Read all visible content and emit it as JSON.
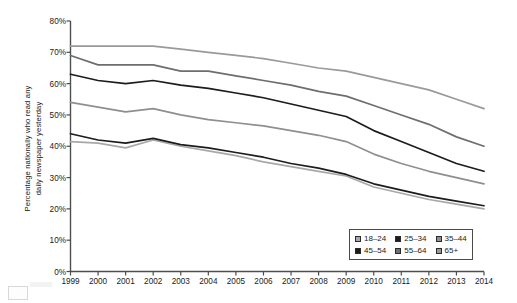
{
  "chart_data": {
    "type": "line",
    "title": "",
    "xlabel": "",
    "ylabel": "Percentage nationally who read any daily newspaper yesterday",
    "x": [
      1999,
      2000,
      2001,
      2002,
      2003,
      2004,
      2005,
      2006,
      2007,
      2008,
      2009,
      2010,
      2011,
      2012,
      2013,
      2014
    ],
    "xticklabels": [
      "1999",
      "2000",
      "2001",
      "2002",
      "2003",
      "2004",
      "2005",
      "2006",
      "2007",
      "2008",
      "2009",
      "2010",
      "2011",
      "2012",
      "2013",
      "2014"
    ],
    "yticklabels": [
      "0%",
      "10%",
      "20%",
      "30%",
      "40%",
      "50%",
      "60%",
      "70%",
      "80%"
    ],
    "yticks": [
      0,
      10,
      20,
      30,
      40,
      50,
      60,
      70,
      80
    ],
    "ylim": [
      0,
      80
    ],
    "xlim": [
      1999,
      2014
    ],
    "grid": false,
    "legend_position": "bottom-right",
    "series": [
      {
        "name": "18–24",
        "color": "#a8a8a8",
        "values": [
          41.5,
          41.0,
          39.5,
          42.0,
          40.0,
          38.5,
          37.0,
          35.0,
          33.5,
          32.0,
          30.5,
          27.0,
          25.0,
          23.0,
          21.5,
          20.0
        ]
      },
      {
        "name": "25–34",
        "color": "#1c1c1c",
        "values": [
          44.0,
          42.0,
          41.0,
          42.5,
          40.5,
          39.5,
          38.0,
          36.5,
          34.5,
          33.0,
          31.0,
          28.0,
          26.0,
          24.0,
          22.5,
          21.0
        ]
      },
      {
        "name": "35–44",
        "color": "#8f8f8f",
        "values": [
          54.0,
          52.5,
          51.0,
          52.0,
          50.0,
          48.5,
          47.5,
          46.5,
          45.0,
          43.5,
          41.5,
          37.5,
          34.5,
          32.0,
          30.0,
          28.0
        ]
      },
      {
        "name": "45–54",
        "color": "#1c1c1c",
        "values": [
          63.0,
          61.0,
          60.0,
          61.0,
          59.5,
          58.5,
          57.0,
          55.5,
          53.5,
          51.5,
          49.5,
          45.0,
          41.5,
          38.0,
          34.5,
          32.0
        ]
      },
      {
        "name": "55–64",
        "color": "#6e6e6e",
        "values": [
          69.0,
          66.0,
          66.0,
          66.0,
          64.0,
          64.0,
          62.5,
          61.0,
          59.5,
          57.5,
          56.0,
          53.0,
          50.0,
          47.0,
          43.0,
          40.0
        ]
      },
      {
        "name": "65+",
        "color": "#9a9a9a",
        "values": [
          72.0,
          72.0,
          72.0,
          72.0,
          71.0,
          70.0,
          69.0,
          68.0,
          66.5,
          65.0,
          64.0,
          62.0,
          60.0,
          58.0,
          55.0,
          52.0
        ]
      }
    ]
  },
  "axis": {
    "y_title_line1": "Percentage nationally who read any",
    "y_title_line2": "daily newspaper yesterday"
  }
}
